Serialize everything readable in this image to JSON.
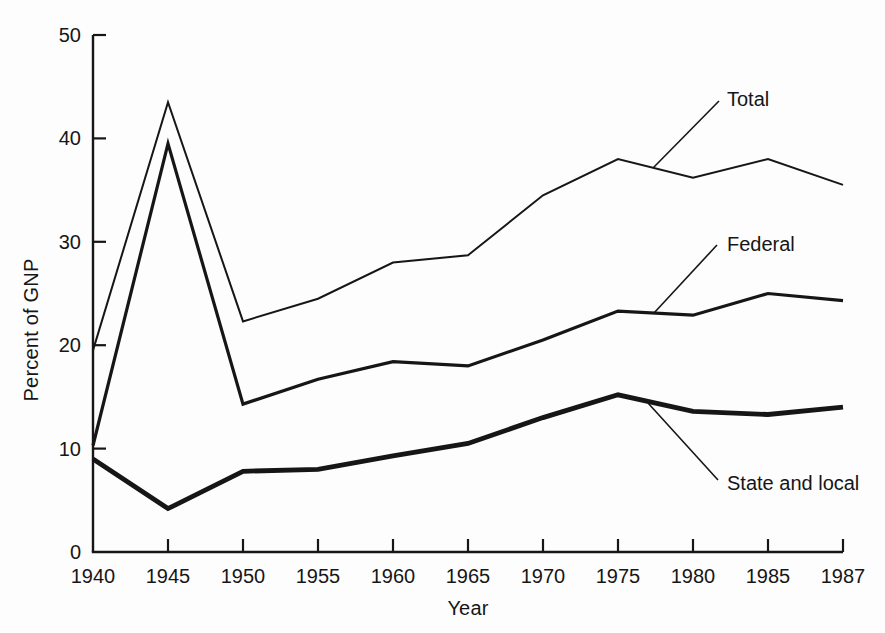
{
  "figure": {
    "background": "#fdfdfd",
    "ink": "#161616"
  },
  "chart_data": {
    "type": "line",
    "title": "",
    "xlabel": "Year",
    "ylabel": "Percent of GNP",
    "x_axis_style": "categorical-equal-spacing",
    "categories": [
      "1940",
      "1945",
      "1950",
      "1955",
      "1960",
      "1965",
      "1970",
      "1975",
      "1980",
      "1985",
      "1987"
    ],
    "ylim": [
      0,
      50
    ],
    "y_ticks": [
      0,
      10,
      20,
      30,
      40,
      50
    ],
    "grid": false,
    "legend_position": "inline-annotations",
    "series": [
      {
        "name": "Total",
        "stroke_width": 2,
        "values": [
          19.5,
          43.5,
          22.3,
          24.5,
          28.0,
          28.7,
          34.5,
          38.0,
          36.2,
          38.0,
          35.5
        ]
      },
      {
        "name": "Federal",
        "stroke_width": 3.2,
        "values": [
          10.3,
          39.5,
          14.3,
          16.7,
          18.4,
          18.0,
          20.5,
          23.3,
          22.9,
          25.0,
          24.3
        ]
      },
      {
        "name": "State and local",
        "stroke_width": 4.8,
        "values": [
          9.0,
          4.2,
          7.8,
          8.0,
          9.3,
          10.5,
          13.0,
          15.2,
          13.6,
          13.3,
          14.0
        ]
      }
    ],
    "annotations": [
      {
        "series": "Total",
        "label": "Total",
        "line_px": [
          653,
          168,
          719,
          101
        ],
        "text_px": [
          727,
          106
        ]
      },
      {
        "series": "Federal",
        "label": "Federal",
        "line_px": [
          654,
          313,
          717,
          245
        ],
        "text_px": [
          727,
          251
        ]
      },
      {
        "series": "State and local",
        "label": "State and local",
        "line_px": [
          648,
          403,
          718,
          480
        ],
        "text_px": [
          727,
          490
        ]
      }
    ]
  }
}
